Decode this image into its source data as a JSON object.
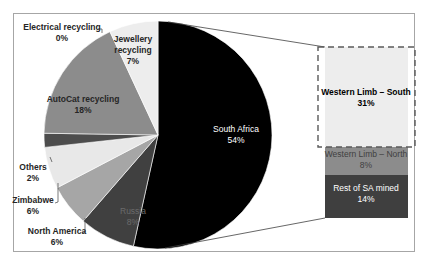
{
  "chart_data": {
    "type": "bar-of-pie",
    "title": "",
    "pie": {
      "categories": [
        "South Africa",
        "Russia",
        "North America",
        "Zimbabwe",
        "Others",
        "AutoCat recycling",
        "Electrical recycling",
        "Jewellery recycling"
      ],
      "values": [
        54,
        8,
        6,
        6,
        2,
        18,
        0,
        7
      ],
      "labels": [
        "South Africa\n54%",
        "Russia\n8%",
        "North America\n6%",
        "Zimbabwe\n6%",
        "Others\n2%",
        "AutoCat recycling\n18%",
        "Electrical recycling\n0%",
        "Jewellery recycling\n7%"
      ],
      "colors": [
        "#000000",
        "#404040",
        "#a6a6a6",
        "#e8e8e8",
        "#4d4d4d",
        "#8c8c8c",
        "#ffffff",
        "#ededed"
      ]
    },
    "bar": {
      "parent": "South Africa",
      "categories": [
        "Western Limb – South",
        "Western Limb – North",
        "Rest of SA mined"
      ],
      "values": [
        31,
        8,
        14
      ],
      "colors": [
        "#ededed",
        "#8c8c8c",
        "#3f3f3f"
      ],
      "highlighted": "Western Limb – South"
    },
    "legend": "none",
    "grid": false
  },
  "labels": {
    "south_africa": [
      "South Africa",
      "54%"
    ],
    "russia": [
      "Russia",
      "8%"
    ],
    "north_america": [
      "North America",
      "6%"
    ],
    "zimbabwe": [
      "Zimbabwe",
      "6%"
    ],
    "others": [
      "Others",
      "2%"
    ],
    "autocat": [
      "AutoCat recycling",
      "18%"
    ],
    "electrical": [
      "Electrical recycling",
      "0%"
    ],
    "jewellery": [
      "Jewellery",
      "recycling",
      "7%"
    ],
    "wl_south": [
      "Western Limb – South",
      "31%"
    ],
    "wl_north": [
      "Western Limb – North",
      "8%"
    ],
    "rest_sa": [
      "Rest of SA mined",
      "14%"
    ]
  }
}
